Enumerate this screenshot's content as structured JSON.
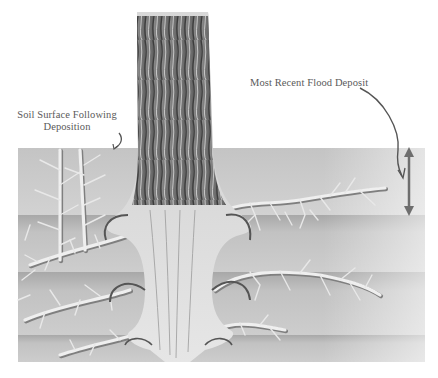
{
  "figure": {
    "labels": {
      "soil_surface_line1": "Soil Surface Following",
      "soil_surface_line2": "Deposition",
      "flood_deposit": "Most Recent Flood Deposit"
    },
    "colors": {
      "background": "#ffffff",
      "soil_light": "#cfcfcf",
      "soil_mid": "#bdbdbd",
      "soil_dark": "#9e9e9e",
      "root": "#eeeeee",
      "root_shadow": "#7a7a7a",
      "bark_dark": "#4a4a4a",
      "bark_light": "#b5b5b5",
      "arrow": "#6e6e6e",
      "text": "#5a5a5a"
    },
    "layers": [
      {
        "name": "most-recent-flood-deposit",
        "top": 148,
        "bottom": 215
      },
      {
        "name": "second-deposit",
        "top": 215,
        "bottom": 272
      },
      {
        "name": "third-deposit",
        "top": 272,
        "bottom": 335
      },
      {
        "name": "original-soil",
        "top": 335,
        "bottom": 362
      }
    ]
  }
}
